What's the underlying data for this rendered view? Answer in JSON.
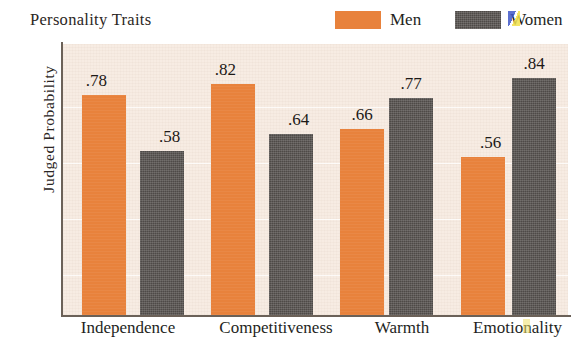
{
  "chart_title": "Personality Traits",
  "ylabel": "Judged Probability",
  "legend": {
    "items": [
      {
        "label": "Men",
        "swatch": "men-color-swatch",
        "color": "#e8823c"
      },
      {
        "label": "Women",
        "swatch": "women-color-swatch",
        "color": "#4e4a47"
      }
    ]
  },
  "xlabels": [
    {
      "text": "Independence"
    },
    {
      "text": "Competitiveness"
    },
    {
      "text": "Warmth"
    },
    {
      "text": "Emotionality"
    }
  ],
  "bars": [
    {
      "name": "bar-independence-men",
      "series": "Men",
      "category": "Independence",
      "value": 0.78,
      "label": ".78"
    },
    {
      "name": "bar-independence-women",
      "series": "Women",
      "category": "Independence",
      "value": 0.58,
      "label": ".58"
    },
    {
      "name": "bar-competitiveness-men",
      "series": "Men",
      "category": "Competitiveness",
      "value": 0.82,
      "label": ".82"
    },
    {
      "name": "bar-competitiveness-women",
      "series": "Women",
      "category": "Competitiveness",
      "value": 0.64,
      "label": ".64"
    },
    {
      "name": "bar-warmth-men",
      "series": "Men",
      "category": "Warmth",
      "value": 0.66,
      "label": ".66"
    },
    {
      "name": "bar-warmth-women",
      "series": "Women",
      "category": "Warmth",
      "value": 0.77,
      "label": ".77"
    },
    {
      "name": "bar-emotionality-men",
      "series": "Men",
      "category": "Emotionality",
      "value": 0.56,
      "label": ".56"
    },
    {
      "name": "bar-emotionality-women",
      "series": "Women",
      "category": "Emotionality",
      "value": 0.84,
      "label": ".84"
    }
  ],
  "colors": {
    "men": "#e8823c",
    "women": "#4e4a47",
    "plot_background": "#f7ece3",
    "page_background": "#ffffff",
    "axis": "#6b6158",
    "gridline": "#ffffff"
  },
  "chart_data": {
    "type": "bar",
    "title": "Personality Traits",
    "xlabel": "",
    "ylabel": "Judged Probability",
    "categories": [
      "Independence",
      "Competitiveness",
      "Warmth",
      "Emotionality"
    ],
    "series": [
      {
        "name": "Men",
        "color": "#e8823c",
        "values": [
          0.78,
          0.82,
          0.66,
          0.56
        ]
      },
      {
        "name": "Women",
        "color": "#4e4a47",
        "values": [
          0.58,
          0.64,
          0.77,
          0.84
        ]
      }
    ],
    "value_labels": [
      [
        ".78",
        ".82",
        ".66",
        ".56"
      ],
      [
        ".58",
        ".64",
        ".77",
        ".84"
      ]
    ],
    "ylim": [
      0,
      0.96
    ],
    "yticks": [],
    "grid": true,
    "grid_orientation": "horizontal",
    "legend_position": "top-right",
    "bar_grouping": "grouped"
  }
}
